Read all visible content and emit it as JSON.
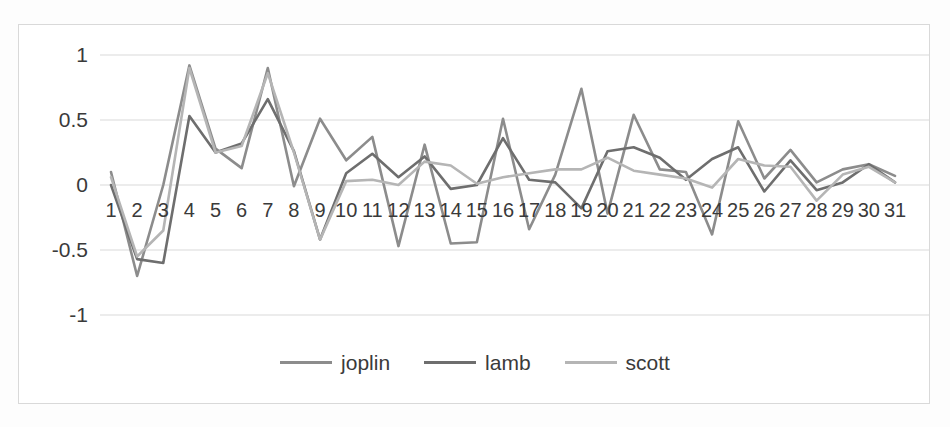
{
  "chart_data": {
    "type": "line",
    "title": "",
    "xlabel": "",
    "ylabel": "",
    "x": [
      1,
      2,
      3,
      4,
      5,
      6,
      7,
      8,
      9,
      10,
      11,
      12,
      13,
      14,
      15,
      16,
      17,
      18,
      19,
      20,
      21,
      22,
      23,
      24,
      25,
      26,
      27,
      28,
      29,
      30,
      31
    ],
    "xlim": [
      1,
      31
    ],
    "ylim": [
      -1.25,
      1.15
    ],
    "yticks": [
      1,
      0.5,
      0,
      -0.5,
      -1
    ],
    "ytick_labels": [
      "1",
      "0.5",
      "0",
      "-0.5",
      "-1"
    ],
    "xtick_labels": [
      "1",
      "2",
      "3",
      "4",
      "5",
      "6",
      "7",
      "8",
      "9",
      "10",
      "11",
      "12",
      "13",
      "14",
      "15",
      "16",
      "17",
      "18",
      "19",
      "20",
      "21",
      "22",
      "23",
      "24",
      "25",
      "26",
      "27",
      "28",
      "29",
      "30",
      "31"
    ],
    "grid": true,
    "grid_axis": "y",
    "legend_position": "bottom",
    "series": [
      {
        "name": "joplin",
        "color": "#8c8c8c",
        "values": [
          0.1,
          -0.7,
          0.0,
          0.92,
          0.28,
          0.13,
          0.9,
          -0.01,
          0.51,
          0.19,
          0.37,
          -0.47,
          0.31,
          -0.45,
          -0.44,
          0.51,
          -0.34,
          0.08,
          0.74,
          -0.22,
          0.54,
          0.12,
          0.1,
          -0.38,
          0.49,
          0.05,
          0.27,
          0.02,
          0.12,
          0.16,
          0.07
        ]
      },
      {
        "name": "lamb",
        "color": "#6e6e6e",
        "values": [
          0.0,
          -0.57,
          -0.6,
          0.53,
          0.25,
          0.32,
          0.66,
          0.26,
          -0.42,
          0.09,
          0.24,
          0.06,
          0.22,
          -0.03,
          0.0,
          0.36,
          0.04,
          0.02,
          -0.18,
          0.26,
          0.29,
          0.21,
          0.04,
          0.2,
          0.29,
          -0.05,
          0.19,
          -0.04,
          0.02,
          0.16,
          0.02
        ]
      },
      {
        "name": "scott",
        "color": "#b5b5b5",
        "values": [
          0.06,
          -0.55,
          -0.35,
          0.9,
          0.25,
          0.3,
          0.86,
          0.25,
          -0.42,
          0.03,
          0.04,
          0.0,
          0.18,
          0.15,
          0.01,
          0.06,
          0.09,
          0.12,
          0.12,
          0.21,
          0.11,
          0.08,
          0.05,
          -0.02,
          0.2,
          0.15,
          0.14,
          -0.12,
          0.08,
          0.14,
          0.02
        ]
      }
    ]
  },
  "legend": {
    "items": [
      {
        "label": "joplin",
        "color": "#8c8c8c"
      },
      {
        "label": "lamb",
        "color": "#6e6e6e"
      },
      {
        "label": "scott",
        "color": "#b5b5b5"
      }
    ]
  },
  "style": {
    "grid_color": "#d9d9d9",
    "border_color": "#d9d9d9",
    "text_color": "#3a3a3a",
    "background": "#ffffff"
  }
}
